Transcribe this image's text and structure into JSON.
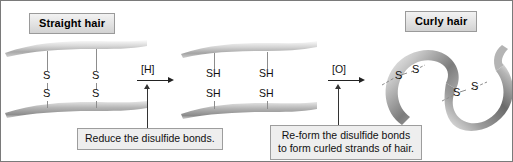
{
  "figure": {
    "background": "#ffffff",
    "border_color": "#7a7a7a"
  },
  "panels": {
    "left": {
      "chip_label": "Straight hair",
      "sulfur_labels": [
        "S",
        "S",
        "S",
        "S"
      ],
      "description": "Two straight hair strands joined by two vertical disulfide (S-S) bridges"
    },
    "middle": {
      "chip_label": "",
      "sulfur_labels": [
        "SH",
        "SH",
        "SH",
        "SH"
      ],
      "description": "Two straight hair strands with four free thiol (SH) groups, bonds broken"
    },
    "right": {
      "chip_label": "Curly hair",
      "sulfur_labels": [
        "S",
        "S",
        "S",
        "S"
      ],
      "description": "One curled hair ribbon with two diagonal disulfide (S-S) bonds holding the curl"
    }
  },
  "reactions": {
    "step1": {
      "reagent": "[H]",
      "caption_lines": [
        "Reduce the disulfide bonds."
      ]
    },
    "step2": {
      "reagent": "[O]",
      "caption_lines": [
        "Re-form the disulfide bonds",
        "to form curled strands of hair."
      ]
    }
  },
  "colors": {
    "chip_fill": "#e2e2e2",
    "chip_border": "#9a9a9a",
    "caption_fill": "#eeeeee",
    "caption_border": "#9d9d9d",
    "bond_line": "#8d8d8d",
    "arrow": "#222222",
    "strand_light": "#f0f0f0",
    "strand_mid": "#b8b8b8",
    "strand_dark": "#6e6e6e"
  }
}
